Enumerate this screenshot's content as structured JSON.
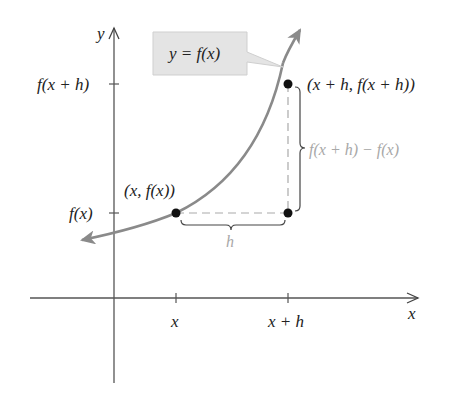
{
  "diagram": {
    "colors": {
      "axis": "#555555",
      "curve": "#8a8a8a",
      "points": "#111111",
      "dashed": "#aaaaaa",
      "callout_fill": "#e4e4e4",
      "callout_stroke": "#cccccc",
      "label_gray": "#a8a8a8",
      "text": "#222222"
    },
    "axes": {
      "x_label": "x",
      "y_label": "y"
    },
    "x_ticks": [
      {
        "label": "x"
      },
      {
        "label": "x + h"
      }
    ],
    "y_ticks": [
      {
        "label": "f(x + h)"
      },
      {
        "label": "f(x)"
      }
    ],
    "callout": {
      "label": "y = f(x)"
    },
    "points": [
      {
        "label": "(x, f(x))"
      },
      {
        "label": "(x + h, f(x + h))"
      }
    ],
    "braces": {
      "horizontal_label": "h",
      "vertical_label": "f(x + h) − f(x)"
    }
  }
}
